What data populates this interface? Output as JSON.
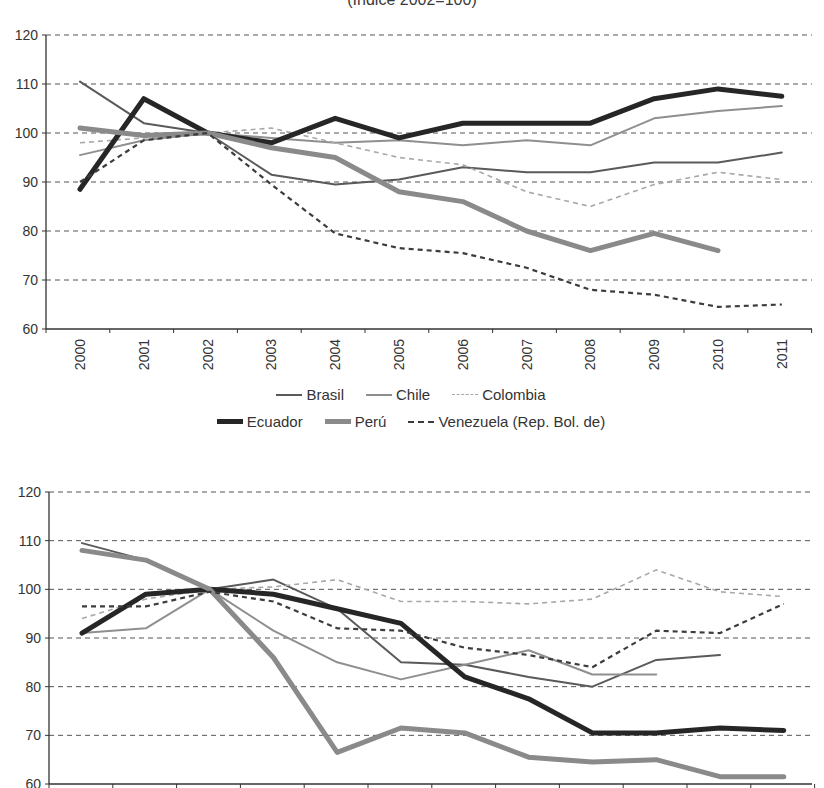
{
  "title": "(Índice 2002=100)",
  "colors": {
    "Brasil": "#5a5a5a",
    "Chile": "#8f8f8f",
    "Colombia": "#a8a8a8",
    "Ecuador": "#262626",
    "Perú": "#8a8a8a",
    "Venezuela (Rep. Bol. de)": "#3c3c3c",
    "grid": "#555555",
    "axis": "#333333"
  },
  "legend": {
    "row1": [
      "Brasil",
      "Chile",
      "Colombia"
    ],
    "row2": [
      "Ecuador",
      "Perú",
      "Venezuela (Rep. Bol. de)"
    ]
  },
  "chart_data": [
    {
      "type": "line",
      "title": "(Índice 2002=100)",
      "xlabel": "",
      "ylabel": "",
      "ylim": [
        60,
        120
      ],
      "yticks": [
        60,
        70,
        80,
        90,
        100,
        110,
        120
      ],
      "grid": "horizontal dashed",
      "legend_position": "bottom",
      "categories": [
        "2000",
        "2001",
        "2002",
        "2003",
        "2004",
        "2005",
        "2006",
        "2007",
        "2008",
        "2009",
        "2010",
        "2011"
      ],
      "series": [
        {
          "name": "Brasil",
          "style": "thin solid dark gray",
          "values": [
            110.5,
            102,
            100,
            91.5,
            89.5,
            90.5,
            93,
            92,
            92,
            94,
            94,
            96
          ]
        },
        {
          "name": "Chile",
          "style": "thin solid light gray",
          "values": [
            95.5,
            98.5,
            100,
            99,
            98,
            98.5,
            97.5,
            98.5,
            97.5,
            103,
            104.5,
            105.5
          ]
        },
        {
          "name": "Colombia",
          "style": "thin dashed light gray",
          "values": [
            98,
            99,
            100,
            101,
            98,
            95,
            93.5,
            88,
            85,
            89.5,
            92,
            90.5
          ]
        },
        {
          "name": "Ecuador",
          "style": "thick solid black",
          "values": [
            88.5,
            107,
            100,
            98,
            103,
            99,
            102,
            102,
            102,
            107,
            109,
            107.5
          ]
        },
        {
          "name": "Perú",
          "style": "thick solid gray",
          "values": [
            101,
            99.5,
            100,
            97,
            95,
            88,
            86,
            80,
            76,
            79.5,
            76,
            null
          ]
        },
        {
          "name": "Venezuela (Rep. Bol. de)",
          "style": "dashed dark",
          "values": [
            90,
            98.5,
            100,
            89.5,
            79.5,
            76.5,
            75.5,
            72.5,
            68,
            67,
            64.5,
            65
          ]
        }
      ]
    },
    {
      "type": "line",
      "title": "",
      "xlabel": "",
      "ylabel": "",
      "ylim": [
        60,
        120
      ],
      "yticks": [
        60,
        70,
        80,
        90,
        100,
        110,
        120
      ],
      "grid": "horizontal dashed",
      "categories": [
        "2000",
        "2001",
        "2002",
        "2003",
        "2004",
        "2005",
        "2006",
        "2007",
        "2008",
        "2009",
        "2010",
        "2011"
      ],
      "series": [
        {
          "name": "Brasil",
          "style": "thin solid dark gray",
          "values": [
            109.5,
            106,
            100,
            102,
            96,
            85,
            84.5,
            82,
            80,
            85.5,
            86.5,
            null
          ]
        },
        {
          "name": "Chile",
          "style": "thin solid light gray",
          "values": [
            91,
            92,
            100,
            91.5,
            85,
            81.5,
            84.5,
            87.5,
            82.5,
            82.5,
            null,
            null
          ]
        },
        {
          "name": "Colombia",
          "style": "thin dashed light gray",
          "values": [
            94,
            98,
            100,
            100.5,
            102,
            97.5,
            97.5,
            97,
            98,
            104,
            99.5,
            98.5
          ]
        },
        {
          "name": "Ecuador",
          "style": "thick solid black",
          "values": [
            91,
            99,
            100,
            99,
            96,
            93,
            82,
            77.5,
            70.5,
            70.5,
            71.5,
            71
          ]
        },
        {
          "name": "Perú",
          "style": "thick solid gray",
          "values": [
            108,
            106,
            100,
            86,
            66.5,
            71.5,
            70.5,
            65.5,
            64.5,
            65,
            61.5,
            61.5
          ]
        },
        {
          "name": "Venezuela (Rep. Bol. de)",
          "style": "dashed dark",
          "values": [
            96.5,
            96.5,
            99.5,
            97.5,
            92,
            91.5,
            88,
            86.5,
            84,
            91.5,
            91,
            97
          ]
        }
      ]
    }
  ]
}
